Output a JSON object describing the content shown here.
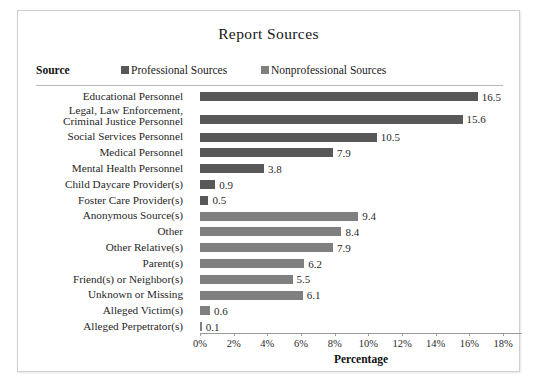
{
  "chart_data": {
    "type": "bar",
    "orientation": "horizontal",
    "title": "Report Sources",
    "xlabel": "Percentage",
    "ylabel": "Source",
    "xlim": [
      0,
      18
    ],
    "xtick_labels": [
      "0%",
      "2%",
      "4%",
      "6%",
      "8%",
      "10%",
      "12%",
      "14%",
      "16%",
      "18%"
    ],
    "xtick_values": [
      0,
      2,
      4,
      6,
      8,
      10,
      12,
      14,
      16,
      18
    ],
    "grid": false,
    "legend_position": "top",
    "legend": [
      {
        "name": "Professional Sources",
        "color": "#585858"
      },
      {
        "name": "Nonprofessional Sources",
        "color": "#808080"
      }
    ],
    "categories": [
      "Educational Personnel",
      "Legal, Law Enforcement,\nCriminal Justice Personnel",
      "Social Services Personnel",
      "Medical Personnel",
      "Mental Health Personnel",
      "Child Daycare Provider(s)",
      "Foster Care Provider(s)",
      "Anonymous Source(s)",
      "Other",
      "Other Relative(s)",
      "Parent(s)",
      "Friend(s) or Neighbor(s)",
      "Unknown or Missing",
      "Alleged Victim(s)",
      "Alleged Perpetrator(s)"
    ],
    "series": [
      {
        "name": "Professional Sources",
        "color": "#585858",
        "values": [
          16.5,
          15.6,
          10.5,
          7.9,
          3.8,
          0.9,
          0.5,
          null,
          null,
          null,
          null,
          null,
          null,
          null,
          null
        ]
      },
      {
        "name": "Nonprofessional Sources",
        "color": "#808080",
        "values": [
          null,
          null,
          null,
          null,
          null,
          null,
          null,
          9.4,
          8.4,
          7.9,
          6.2,
          5.5,
          6.1,
          0.6,
          0.1
        ]
      }
    ],
    "bars": [
      {
        "label": "Educational Personnel",
        "value": 16.5,
        "value_label": "16.5",
        "group": "Professional Sources"
      },
      {
        "label": "Legal, Law Enforcement,\nCriminal Justice Personnel",
        "value": 15.6,
        "value_label": "15.6",
        "group": "Professional Sources"
      },
      {
        "label": "Social Services Personnel",
        "value": 10.5,
        "value_label": "10.5",
        "group": "Professional Sources"
      },
      {
        "label": "Medical Personnel",
        "value": 7.9,
        "value_label": "7.9",
        "group": "Professional Sources"
      },
      {
        "label": "Mental Health Personnel",
        "value": 3.8,
        "value_label": "3.8",
        "group": "Professional Sources"
      },
      {
        "label": "Child Daycare Provider(s)",
        "value": 0.9,
        "value_label": "0.9",
        "group": "Professional Sources"
      },
      {
        "label": "Foster Care Provider(s)",
        "value": 0.5,
        "value_label": "0.5",
        "group": "Professional Sources"
      },
      {
        "label": "Anonymous Source(s)",
        "value": 9.4,
        "value_label": "9.4",
        "group": "Nonprofessional Sources"
      },
      {
        "label": "Other",
        "value": 8.4,
        "value_label": "8.4",
        "group": "Nonprofessional Sources"
      },
      {
        "label": "Other Relative(s)",
        "value": 7.9,
        "value_label": "7.9",
        "group": "Nonprofessional Sources"
      },
      {
        "label": "Parent(s)",
        "value": 6.2,
        "value_label": "6.2",
        "group": "Nonprofessional Sources"
      },
      {
        "label": "Friend(s) or Neighbor(s)",
        "value": 5.5,
        "value_label": "5.5",
        "group": "Nonprofessional Sources"
      },
      {
        "label": "Unknown or Missing",
        "value": 6.1,
        "value_label": "6.1",
        "group": "Nonprofessional Sources"
      },
      {
        "label": "Alleged Victim(s)",
        "value": 0.6,
        "value_label": "0.6",
        "group": "Nonprofessional Sources"
      },
      {
        "label": "Alleged Perpetrator(s)",
        "value": 0.1,
        "value_label": "0.1",
        "group": "Nonprofessional Sources"
      }
    ]
  },
  "header": {
    "title": "Report Sources"
  },
  "legend": {
    "source_header": "Source",
    "professional_label": "Professional Sources",
    "nonprofessional_label": "Nonprofessional Sources"
  },
  "axis": {
    "title": "Percentage"
  },
  "colors": {
    "professional": "#585858",
    "nonprofessional": "#808080",
    "frame_border": "#cfcfcf",
    "rule": "#b9b9b9",
    "axis": "#9a9a9a"
  }
}
